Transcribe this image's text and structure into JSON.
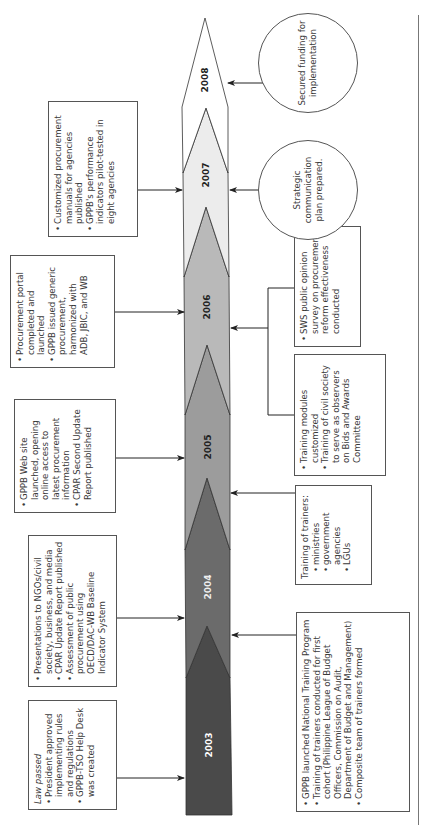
{
  "figure": {
    "orientation": "rotated-90-ccw",
    "timeline": {
      "years": [
        "2003",
        "2004",
        "2005",
        "2006",
        "2007",
        "2008"
      ],
      "segment_colors": [
        "#4a4a4a",
        "#6b6b6b",
        "#9a9a9a",
        "#b8b8b8",
        "#ededed",
        "#ffffff"
      ],
      "year_label_colors": [
        "#ffffff",
        "#eeeeee",
        "#222222",
        "#222222",
        "#222222",
        "#222222"
      ]
    },
    "above": {
      "y2003": {
        "intro": "Law passed",
        "items": [
          "President approved implementing rules and regulations",
          "GPPB-TSO Help Desk was created"
        ]
      },
      "y2004": {
        "items": [
          "Presentations to NGOs/civil society, business, and media",
          "CPAR Update Report published",
          "Assessment of public procurement using OECD/DAC-WB Baseline Indicator System"
        ]
      },
      "y2005": {
        "items": [
          "GPPB Web site launched, opening online access to latest procurement information",
          "CPAR Second Update Report published"
        ]
      },
      "y2006": {
        "items": [
          "Procurement portal completed and launched",
          "GPPB issued generic procurement, harmonized with ADB, JBIC, and WB"
        ]
      },
      "y2007": {
        "items": [
          "Customized procurement manuals for agencies published",
          "GPPB's performance indicators pilot-tested in eight agencies"
        ]
      }
    },
    "below": {
      "y2003": {
        "items": [
          "GPPB launched National Training Program",
          "Training of trainers conducted for first cohort (Philippine League of Budget Officers, Commission on Audit, Department of Budget and Management)",
          "Composite team of trainers formed"
        ]
      },
      "y2004": {
        "intro": "Training of trainers:",
        "sub_items": [
          "ministries",
          "government agencies",
          "LGUs"
        ]
      },
      "y2005": {
        "items": [
          "Training modules customized",
          "Training of civil society to serve as observers on Bids and Awards Committee"
        ]
      },
      "y2006": {
        "items": [
          "SWS public opinion survey on procurement reform effectiveness conducted"
        ]
      },
      "y2007": {
        "text": "Strategic communication plan prepared."
      },
      "y2008": {
        "text": "Secured funding for implementation"
      }
    }
  }
}
